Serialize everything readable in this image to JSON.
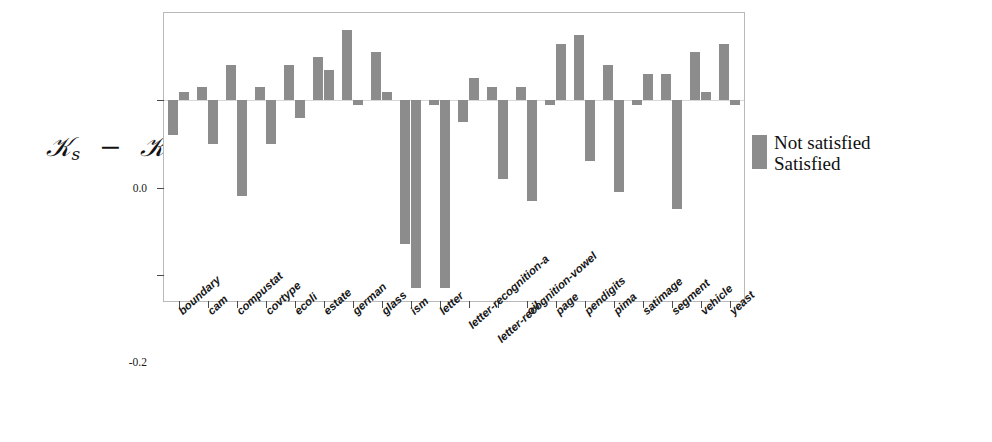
{
  "chart_data": {
    "type": "bar",
    "title": "",
    "subtitle": "",
    "xlabel": "",
    "ylabel": "Ks - K",
    "ylabel_parts": {
      "main": "K",
      "subscript": "s",
      "operator": "−",
      "second": "K"
    },
    "ylim": [
      -0.46,
      0.2
    ],
    "yticks": [
      0.0,
      -0.2,
      -0.4
    ],
    "ytick_labels": [
      "0.0",
      "-0.2",
      "-0.4"
    ],
    "grid": false,
    "orientation": "vertical",
    "bar_color": "#8c8c8c",
    "legend_position": "right",
    "categories": [
      "boundary",
      "cam",
      "compustat",
      "covtype",
      "ecoli",
      "estate",
      "german",
      "glass",
      "ism",
      "letter",
      "letter-recognition-a",
      "letter-recognition-vowel",
      "oil",
      "page",
      "pendigits",
      "pima",
      "satimage",
      "segment",
      "vehicle",
      "yeast"
    ],
    "series": [
      {
        "name": "Not satisfied",
        "color": "#8c8c8c",
        "values": [
          -0.08,
          0.03,
          0.08,
          0.03,
          0.08,
          0.1,
          0.16,
          0.11,
          -0.33,
          -0.01,
          -0.05,
          0.03,
          0.03,
          -0.01,
          0.15,
          0.08,
          -0.01,
          0.06,
          0.11,
          0.13
        ]
      },
      {
        "name": "Satisfied",
        "color": "#8c8c8c",
        "values": [
          0.02,
          -0.1,
          -0.22,
          -0.1,
          -0.04,
          0.07,
          -0.01,
          0.02,
          -0.43,
          -0.43,
          0.05,
          -0.18,
          -0.23,
          0.13,
          -0.14,
          -0.21,
          0.06,
          -0.25,
          0.02,
          -0.01
        ]
      }
    ]
  },
  "legend": {
    "entries": [
      {
        "label": "Not satisfied",
        "color": "#8c8c8c"
      },
      {
        "label": "Satisfied",
        "color": "#8c8c8c"
      }
    ]
  }
}
